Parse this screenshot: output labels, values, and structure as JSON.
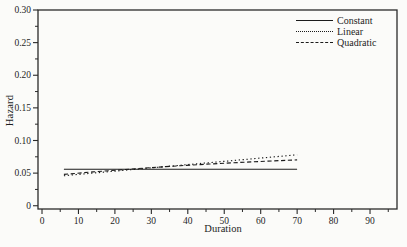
{
  "figure": {
    "background": "#fbfbf9",
    "axis_color": "#2a2a2a",
    "line_color": "#1b1b1b"
  },
  "chart_data": {
    "type": "line",
    "title": "",
    "xlabel": "Duration",
    "ylabel": "Hazard",
    "xlim": [
      -1.1,
      97.4
    ],
    "ylim": [
      -0.005,
      0.3
    ],
    "grid": false,
    "legend_position": "top-right",
    "x_major_ticks": [
      0,
      10,
      20,
      30,
      40,
      50,
      60,
      70,
      80,
      90
    ],
    "x_major_tick_labels": [
      "0",
      "10",
      "20",
      "30",
      "40",
      "50",
      "60",
      "70",
      "80",
      "90"
    ],
    "x_minor_ticks": [
      5,
      15,
      25,
      35,
      45,
      55,
      65,
      75,
      85,
      95
    ],
    "y_major_ticks": [
      0,
      0.05,
      0.1,
      0.15,
      0.2,
      0.25,
      0.3
    ],
    "y_major_tick_labels": [
      "0",
      "0.05",
      "0.10",
      "0.15",
      "0.20",
      "0.25",
      "0.30"
    ],
    "y_minor_ticks": [
      0.025,
      0.075,
      0.125,
      0.175,
      0.225,
      0.275
    ],
    "series": [
      {
        "name": "Constant",
        "style": "solid",
        "points": [
          [
            6,
            0.056
          ],
          [
            70,
            0.056
          ]
        ]
      },
      {
        "name": "Linear",
        "style": "dotted",
        "points": [
          [
            6,
            0.046
          ],
          [
            70,
            0.078
          ]
        ]
      },
      {
        "name": "Quadratic",
        "style": "dashed",
        "points": [
          [
            6,
            0.048
          ],
          [
            14,
            0.0518
          ],
          [
            22,
            0.0552
          ],
          [
            30,
            0.0584
          ],
          [
            38,
            0.0613
          ],
          [
            46,
            0.064
          ],
          [
            54,
            0.0663
          ],
          [
            62,
            0.0684
          ],
          [
            70,
            0.0702
          ]
        ]
      }
    ]
  }
}
